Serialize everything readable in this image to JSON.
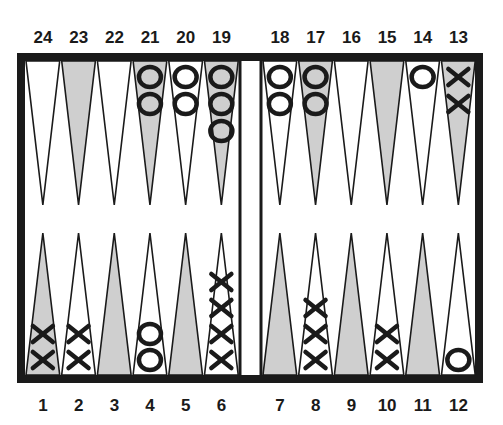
{
  "board": {
    "colors": {
      "frame": "#1a1a1a",
      "shaded_point": "#cfcfcf",
      "light_point": "#ffffff",
      "checker_ink": "#1a1a1a"
    },
    "top_labels": [
      "24",
      "23",
      "22",
      "21",
      "20",
      "19",
      "18",
      "17",
      "16",
      "15",
      "14",
      "13"
    ],
    "bottom_labels": [
      "1",
      "2",
      "3",
      "4",
      "5",
      "6",
      "7",
      "8",
      "9",
      "10",
      "11",
      "12"
    ],
    "points": [
      {
        "n": 1,
        "shaded": true,
        "checker": "X",
        "count": 2
      },
      {
        "n": 2,
        "shaded": false,
        "checker": "X",
        "count": 2
      },
      {
        "n": 3,
        "shaded": true,
        "checker": "",
        "count": 0
      },
      {
        "n": 4,
        "shaded": false,
        "checker": "O",
        "count": 2
      },
      {
        "n": 5,
        "shaded": true,
        "checker": "",
        "count": 0
      },
      {
        "n": 6,
        "shaded": false,
        "checker": "X",
        "count": 4
      },
      {
        "n": 7,
        "shaded": true,
        "checker": "",
        "count": 0
      },
      {
        "n": 8,
        "shaded": false,
        "checker": "X",
        "count": 3
      },
      {
        "n": 9,
        "shaded": true,
        "checker": "",
        "count": 0
      },
      {
        "n": 10,
        "shaded": false,
        "checker": "X",
        "count": 2
      },
      {
        "n": 11,
        "shaded": true,
        "checker": "",
        "count": 0
      },
      {
        "n": 12,
        "shaded": false,
        "checker": "O",
        "count": 1
      },
      {
        "n": 13,
        "shaded": true,
        "checker": "X",
        "count": 2
      },
      {
        "n": 14,
        "shaded": false,
        "checker": "O",
        "count": 1
      },
      {
        "n": 15,
        "shaded": true,
        "checker": "",
        "count": 0
      },
      {
        "n": 16,
        "shaded": false,
        "checker": "",
        "count": 0
      },
      {
        "n": 17,
        "shaded": true,
        "checker": "O",
        "count": 2
      },
      {
        "n": 18,
        "shaded": false,
        "checker": "O",
        "count": 2
      },
      {
        "n": 19,
        "shaded": true,
        "checker": "O",
        "count": 3
      },
      {
        "n": 20,
        "shaded": false,
        "checker": "O",
        "count": 2
      },
      {
        "n": 21,
        "shaded": true,
        "checker": "O",
        "count": 2
      },
      {
        "n": 22,
        "shaded": false,
        "checker": "",
        "count": 0
      },
      {
        "n": 23,
        "shaded": true,
        "checker": "",
        "count": 0
      },
      {
        "n": 24,
        "shaded": false,
        "checker": "",
        "count": 0
      }
    ]
  }
}
